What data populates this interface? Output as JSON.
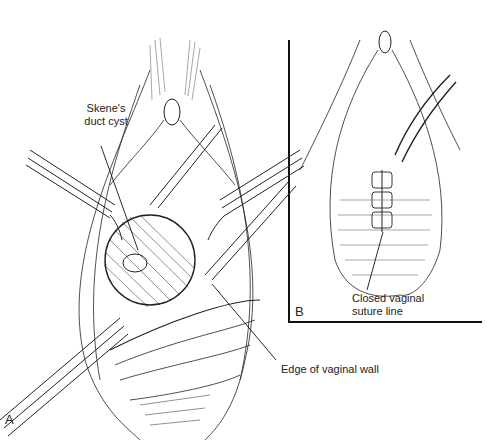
{
  "figure": {
    "panels": [
      {
        "id": "A",
        "letter": "A"
      },
      {
        "id": "B",
        "letter": "B"
      }
    ],
    "labels": {
      "skene_line1": "Skene's",
      "skene_line2": "duct cyst",
      "edge": "Edge of vaginal wall",
      "closed_line1": "Closed vaginal",
      "closed_line2": "suture line"
    },
    "colors": {
      "ink": "#1a1a1a",
      "background": "#ffffff"
    }
  }
}
